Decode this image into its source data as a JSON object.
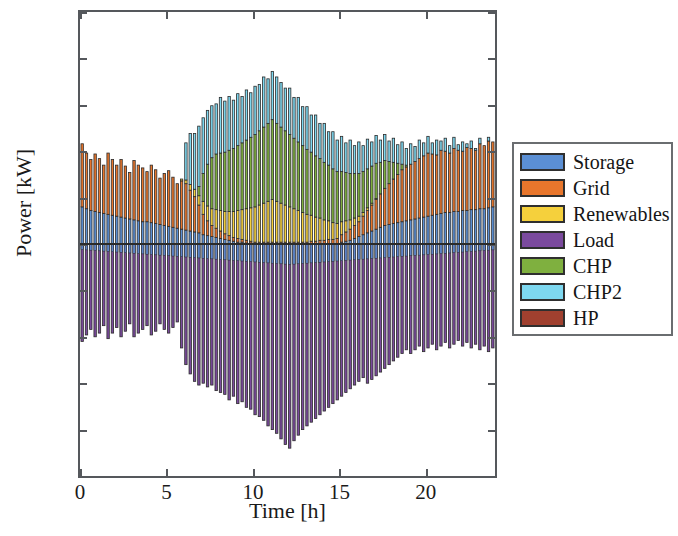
{
  "chart_data": {
    "type": "bar",
    "subtype": "stacked-bar-positive-negative",
    "title": "",
    "xlabel": "Time [h]",
    "ylabel": "Power [kW]",
    "xlim": [
      0,
      24
    ],
    "ylim": [
      -250,
      250
    ],
    "xticks": [
      0,
      5,
      10,
      15,
      20
    ],
    "yticks": [
      -250,
      -200,
      -150,
      -100,
      -50,
      0,
      50,
      100,
      150,
      200,
      250
    ],
    "grid": false,
    "legend_position": "right-outside",
    "bar_interval_hours": 0.25,
    "x": [
      0.0,
      0.25,
      0.5,
      0.75,
      1.0,
      1.25,
      1.5,
      1.75,
      2.0,
      2.25,
      2.5,
      2.75,
      3.0,
      3.25,
      3.5,
      3.75,
      4.0,
      4.25,
      4.5,
      4.75,
      5.0,
      5.25,
      5.5,
      5.75,
      6.0,
      6.25,
      6.5,
      6.75,
      7.0,
      7.25,
      7.5,
      7.75,
      8.0,
      8.25,
      8.5,
      8.75,
      9.0,
      9.25,
      9.5,
      9.75,
      10.0,
      10.25,
      10.5,
      10.75,
      11.0,
      11.25,
      11.5,
      11.75,
      12.0,
      12.25,
      12.5,
      12.75,
      13.0,
      13.25,
      13.5,
      13.75,
      14.0,
      14.25,
      14.5,
      14.75,
      15.0,
      15.25,
      15.5,
      15.75,
      16.0,
      16.25,
      16.5,
      16.75,
      17.0,
      17.25,
      17.5,
      17.75,
      18.0,
      18.25,
      18.5,
      18.75,
      19.0,
      19.25,
      19.5,
      19.75,
      20.0,
      20.25,
      20.5,
      20.75,
      21.0,
      21.25,
      21.5,
      21.75,
      22.0,
      22.25,
      22.5,
      22.75,
      23.0,
      23.25,
      23.5,
      23.75
    ],
    "series": [
      {
        "name": "Storage",
        "color": "#5B8FD4",
        "values": [
          40,
          38,
          36,
          35,
          34,
          33,
          32,
          31,
          30,
          29,
          28,
          27,
          26,
          25,
          24,
          24,
          23,
          22,
          21,
          20,
          19,
          18,
          17,
          16,
          15,
          14,
          13,
          12,
          10,
          9,
          8,
          7,
          6,
          5,
          4,
          3,
          2,
          2,
          1,
          1,
          0,
          0,
          0,
          0,
          0,
          0,
          0,
          0,
          0,
          0,
          0,
          0,
          0,
          0,
          0,
          0,
          0,
          0,
          0,
          0,
          2,
          3,
          4,
          6,
          8,
          10,
          12,
          14,
          16,
          18,
          20,
          21,
          22,
          23,
          24,
          25,
          26,
          27,
          28,
          29,
          30,
          31,
          32,
          33,
          34,
          34,
          35,
          35,
          36,
          36,
          37,
          37,
          38,
          38,
          39,
          40
        ]
      },
      {
        "name": "Grid",
        "color": "#E8762C",
        "values": [
          68,
          60,
          55,
          62,
          58,
          52,
          66,
          60,
          55,
          62,
          56,
          50,
          64,
          60,
          58,
          54,
          62,
          58,
          50,
          56,
          60,
          54,
          48,
          52,
          50,
          44,
          38,
          30,
          22,
          16,
          12,
          10,
          8,
          6,
          5,
          4,
          4,
          3,
          3,
          2,
          2,
          2,
          2,
          2,
          2,
          2,
          2,
          2,
          2,
          2,
          2,
          2,
          2,
          3,
          3,
          4,
          4,
          5,
          5,
          6,
          8,
          10,
          12,
          14,
          16,
          20,
          24,
          28,
          32,
          36,
          40,
          44,
          48,
          52,
          56,
          58,
          60,
          62,
          64,
          66,
          68,
          66,
          64,
          68,
          66,
          64,
          68,
          66,
          64,
          68,
          66,
          64,
          70,
          68,
          72,
          70
        ]
      },
      {
        "name": "Renewables",
        "color": "#F5D03C",
        "values": [
          0,
          0,
          0,
          0,
          0,
          0,
          0,
          0,
          0,
          0,
          0,
          0,
          0,
          0,
          0,
          0,
          0,
          0,
          0,
          0,
          0,
          0,
          0,
          2,
          4,
          6,
          8,
          10,
          14,
          16,
          18,
          20,
          22,
          24,
          26,
          28,
          30,
          32,
          34,
          36,
          38,
          40,
          42,
          44,
          46,
          44,
          42,
          40,
          38,
          36,
          34,
          32,
          30,
          28,
          26,
          24,
          22,
          20,
          18,
          16,
          14,
          12,
          10,
          8,
          6,
          4,
          3,
          2,
          1,
          0,
          0,
          0,
          0,
          0,
          0,
          0,
          0,
          0,
          0,
          0,
          0,
          0,
          0,
          0,
          0,
          0,
          0,
          0,
          0,
          0,
          0,
          0,
          0,
          0,
          0,
          0
        ]
      },
      {
        "name": "CHP",
        "color": "#7FB03F",
        "values": [
          0,
          0,
          0,
          0,
          0,
          0,
          0,
          0,
          0,
          0,
          0,
          0,
          0,
          0,
          0,
          0,
          0,
          0,
          0,
          0,
          0,
          0,
          0,
          0,
          0,
          0,
          0,
          10,
          30,
          45,
          55,
          60,
          62,
          64,
          66,
          68,
          70,
          72,
          74,
          76,
          78,
          80,
          82,
          84,
          86,
          84,
          82,
          80,
          78,
          76,
          74,
          72,
          70,
          68,
          66,
          64,
          62,
          60,
          58,
          56,
          54,
          52,
          50,
          48,
          46,
          44,
          42,
          40,
          38,
          34,
          30,
          24,
          18,
          12,
          6,
          2,
          0,
          0,
          0,
          0,
          0,
          0,
          0,
          0,
          0,
          0,
          0,
          0,
          0,
          0,
          0,
          0,
          0,
          0,
          0,
          0
        ]
      },
      {
        "name": "CHP2",
        "color": "#7ED8F0",
        "values": [
          0,
          0,
          0,
          0,
          0,
          0,
          0,
          0,
          0,
          0,
          0,
          0,
          0,
          0,
          0,
          0,
          0,
          0,
          0,
          0,
          0,
          0,
          0,
          0,
          40,
          55,
          60,
          65,
          60,
          58,
          56,
          54,
          60,
          55,
          58,
          52,
          56,
          50,
          54,
          48,
          52,
          50,
          54,
          48,
          52,
          50,
          48,
          46,
          50,
          44,
          48,
          42,
          46,
          40,
          44,
          38,
          42,
          36,
          40,
          34,
          38,
          32,
          36,
          30,
          34,
          28,
          32,
          26,
          30,
          24,
          28,
          22,
          26,
          20,
          24,
          18,
          22,
          16,
          20,
          14,
          18,
          12,
          16,
          10,
          14,
          8,
          12,
          6,
          10,
          4,
          8,
          2,
          6,
          0,
          4,
          0
        ]
      },
      {
        "name": "HP",
        "color": "#A0402F",
        "values": [
          0,
          0,
          0,
          0,
          0,
          0,
          0,
          0,
          0,
          0,
          0,
          0,
          0,
          0,
          0,
          0,
          0,
          0,
          0,
          0,
          0,
          0,
          0,
          0,
          0,
          0,
          0,
          0,
          0,
          0,
          0,
          0,
          0,
          0,
          0,
          0,
          0,
          0,
          0,
          0,
          0,
          0,
          0,
          0,
          0,
          0,
          0,
          0,
          0,
          0,
          0,
          0,
          0,
          0,
          0,
          0,
          0,
          0,
          0,
          0,
          0,
          0,
          0,
          0,
          0,
          0,
          0,
          0,
          0,
          0,
          0,
          0,
          0,
          0,
          0,
          0,
          0,
          0,
          0,
          0,
          0,
          0,
          0,
          0,
          0,
          0,
          0,
          0,
          0,
          0,
          0,
          0,
          0,
          0,
          0,
          0
        ]
      },
      {
        "name": "Load",
        "color": "#7B4A9E",
        "values": [
          -105,
          -98,
          -92,
          -100,
          -96,
          -88,
          -102,
          -96,
          -90,
          -100,
          -94,
          -86,
          -100,
          -96,
          -92,
          -88,
          -98,
          -94,
          -86,
          -92,
          -96,
          -90,
          -84,
          -112,
          -130,
          -140,
          -148,
          -152,
          -150,
          -154,
          -152,
          -158,
          -160,
          -162,
          -168,
          -164,
          -172,
          -170,
          -176,
          -178,
          -184,
          -186,
          -190,
          -196,
          -200,
          -204,
          -210,
          -216,
          -220,
          -212,
          -206,
          -200,
          -196,
          -192,
          -188,
          -184,
          -180,
          -176,
          -172,
          -168,
          -164,
          -160,
          -156,
          -152,
          -148,
          -144,
          -150,
          -146,
          -142,
          -138,
          -134,
          -130,
          -126,
          -122,
          -118,
          -114,
          -118,
          -114,
          -110,
          -116,
          -112,
          -108,
          -114,
          -110,
          -106,
          -112,
          -108,
          -104,
          -110,
          -106,
          -112,
          -108,
          -114,
          -110,
          -116,
          -112
        ]
      }
    ],
    "peak_positive_kw": 215,
    "peak_negative_kw": -222,
    "units": "kW"
  },
  "axes": {
    "y_tick_labels": [
      "250",
      "200",
      "150",
      "100",
      "50",
      "0",
      "−50",
      "−100",
      "−150",
      "−200",
      "−250"
    ],
    "y_tick_values": [
      250,
      200,
      150,
      100,
      50,
      0,
      -50,
      -100,
      -150,
      -200,
      -250
    ],
    "x_tick_labels": [
      "0",
      "5",
      "10",
      "15",
      "20"
    ],
    "x_tick_values": [
      0,
      5,
      10,
      15,
      20
    ],
    "y_axis_title": "Power [kW]",
    "x_axis_title": "Time [h]"
  },
  "legend": {
    "items": [
      {
        "label": "Storage",
        "color": "#5B8FD4"
      },
      {
        "label": "Grid",
        "color": "#E8762C"
      },
      {
        "label": "Renewables",
        "color": "#F5D03C"
      },
      {
        "label": "Load",
        "color": "#7B4A9E"
      },
      {
        "label": "CHP",
        "color": "#7FB03F"
      },
      {
        "label": "CHP2",
        "color": "#7ED8F0"
      },
      {
        "label": "HP",
        "color": "#A0402F"
      }
    ]
  },
  "style": {
    "frame_color": "#55585c",
    "zero_line_color": "#2b2b2b",
    "bar_edge_color": "#2b2b2b",
    "background": "#ffffff"
  }
}
